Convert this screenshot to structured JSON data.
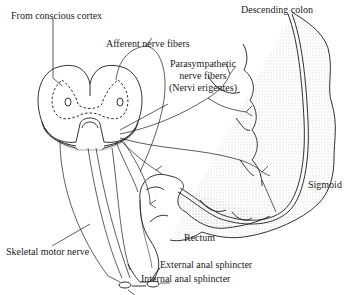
{
  "diagram": {
    "colors": {
      "ink": "#1a1a1a",
      "stipple": "#bdbdbd",
      "background": "#ffffff"
    },
    "labels": {
      "conscious_cortex": "From conscious cortex",
      "afferent": "Afferent nerve fibers",
      "parasympathetic_line1": "Parasympathetic",
      "parasympathetic_line2": "nerve fibers",
      "parasympathetic_line3": "(Nervi erigentes)",
      "descending_colon": "Descending colon",
      "sigmoid": "Sigmoid",
      "rectum": "Rectum",
      "skeletal_motor": "Skeletal motor nerve",
      "external_sphincter": "External anal sphincter",
      "internal_sphincter": "Internal anal sphincter"
    },
    "structures": [
      "spinal-cord-cross-section",
      "descending-colon",
      "sigmoid-colon",
      "rectum",
      "external-anal-sphincter",
      "internal-anal-sphincter"
    ]
  }
}
